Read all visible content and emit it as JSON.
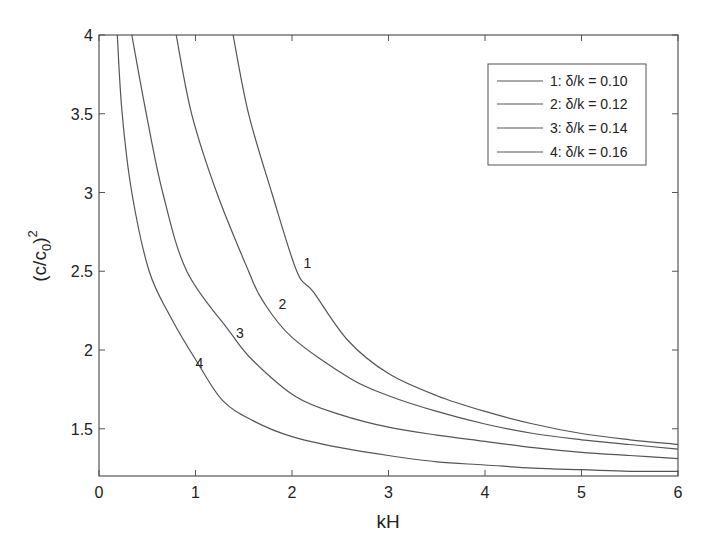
{
  "chart_data": {
    "type": "line",
    "title": "",
    "xlabel": "kH",
    "ylabel": "(c/c0)^2",
    "ylabel_parts": {
      "base": "(c/c",
      "sub": "0",
      "close": ")",
      "sup": "2"
    },
    "xlim": [
      0,
      6
    ],
    "ylim": [
      1.2,
      4
    ],
    "xticks": [
      0,
      1,
      2,
      3,
      4,
      5,
      6
    ],
    "xtick_labels": [
      "0",
      "1",
      "2",
      "3",
      "4",
      "5",
      "6"
    ],
    "yticks": [
      1.5,
      2,
      2.5,
      3,
      3.5,
      4
    ],
    "ytick_labels": [
      "1.5",
      "2",
      "2.5",
      "3",
      "3.5",
      "4"
    ],
    "grid": false,
    "legend_position": "upper right",
    "line_color": "#555555",
    "series": [
      {
        "name": "1: δ/k = 0.10",
        "label": "1",
        "label_pos": [
          2.12,
          2.55
        ],
        "x": [
          1.39,
          1.55,
          1.79,
          2.05,
          2.22,
          2.58,
          3.0,
          3.5,
          4.0,
          4.5,
          5.0,
          5.5,
          6.0
        ],
        "y": [
          4.0,
          3.5,
          3.0,
          2.5,
          2.37,
          2.06,
          1.85,
          1.71,
          1.61,
          1.53,
          1.47,
          1.43,
          1.4
        ]
      },
      {
        "name": "2: δ/k = 0.12",
        "label": "2",
        "label_pos": [
          1.86,
          2.29
        ],
        "x": [
          0.8,
          0.96,
          1.22,
          1.55,
          1.7,
          2.0,
          2.6,
          3.0,
          3.5,
          4.0,
          4.5,
          5.0,
          5.5,
          6.0
        ],
        "y": [
          4.0,
          3.5,
          3.0,
          2.5,
          2.31,
          2.08,
          1.82,
          1.71,
          1.61,
          1.53,
          1.47,
          1.43,
          1.4,
          1.37
        ]
      },
      {
        "name": "3: δ/k = 0.14",
        "label": "3",
        "label_pos": [
          1.42,
          2.11
        ],
        "x": [
          0.34,
          0.49,
          0.66,
          0.91,
          1.35,
          1.6,
          2.05,
          2.5,
          3.0,
          3.5,
          4.0,
          4.5,
          5.0,
          5.5,
          6.0
        ],
        "y": [
          4.0,
          3.5,
          3.0,
          2.5,
          2.12,
          1.93,
          1.7,
          1.59,
          1.51,
          1.46,
          1.42,
          1.38,
          1.35,
          1.33,
          1.31
        ]
      },
      {
        "name": "4: δ/k = 0.16",
        "label": "4",
        "label_pos": [
          1.0,
          1.92
        ],
        "x": [
          0.19,
          0.24,
          0.34,
          0.52,
          0.75,
          1.01,
          1.28,
          1.6,
          2.0,
          2.5,
          3.0,
          3.5,
          4.0,
          4.5,
          5.0,
          5.5,
          6.0
        ],
        "y": [
          4.0,
          3.5,
          3.0,
          2.5,
          2.2,
          1.93,
          1.68,
          1.55,
          1.45,
          1.38,
          1.33,
          1.29,
          1.27,
          1.25,
          1.24,
          1.23,
          1.23
        ]
      }
    ]
  },
  "legend": {
    "items": [
      {
        "label": "1: δ/k = 0.10"
      },
      {
        "label": "2: δ/k = 0.12"
      },
      {
        "label": "3: δ/k = 0.14"
      },
      {
        "label": "4: δ/k = 0.16"
      }
    ]
  }
}
